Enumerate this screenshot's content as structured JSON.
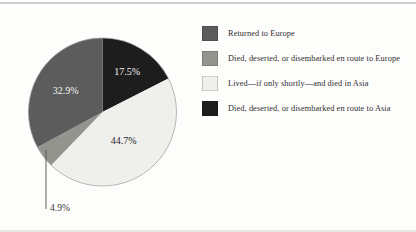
{
  "page": {
    "background": "#fdfdfc",
    "top_rule_color": "#cfcfcf",
    "bottom_rule_color": "#e7e7e5"
  },
  "chart_data": {
    "type": "pie",
    "title": "",
    "legend_position": "right",
    "direction": "counterclockwise-from-12-oclock-in-legend-order",
    "outline_color": "#9b9b9b",
    "leader_line_color": "#4d4d4d",
    "slices": [
      {
        "legend_label": "Returned to Europe",
        "label": "32.9%",
        "value": 32.9,
        "color": "#5c5c5c",
        "label_color": "#f5f5f3"
      },
      {
        "legend_label": "Died, deserted, or disembarked en route to Europe",
        "label": "4.9%",
        "value": 4.9,
        "color": "#94948f",
        "label_color": "#3a3a3a"
      },
      {
        "legend_label": "Lived—if only shortly—and died in Asia",
        "label": "44.7%",
        "value": 44.7,
        "color": "#efefec",
        "label_color": "#272727"
      },
      {
        "legend_label": "Died, deserted, or disembarked en route to Asia",
        "label": "17.5%",
        "value": 17.5,
        "color": "#1d1d1d",
        "label_color": "#f5f5f3"
      }
    ]
  }
}
